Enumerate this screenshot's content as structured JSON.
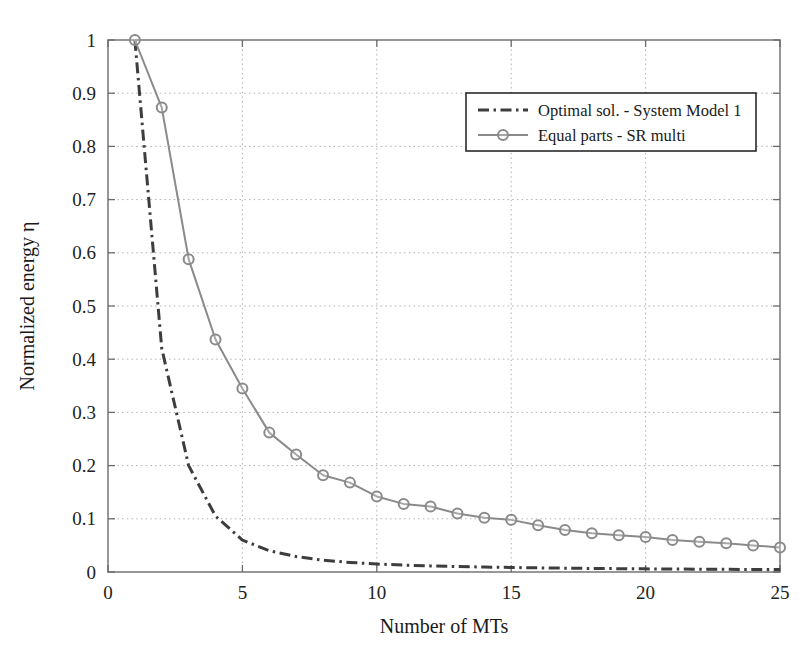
{
  "chart_data": {
    "type": "line",
    "title": "",
    "xlabel": "Number of MTs",
    "ylabel": "Normalized energy η",
    "xlim": [
      0,
      25
    ],
    "ylim": [
      0,
      1
    ],
    "xticks": [
      0,
      5,
      10,
      15,
      20,
      25
    ],
    "xtick_labels": [
      "0",
      "5",
      "10",
      "15",
      "20",
      "25"
    ],
    "yticks": [
      0,
      0.1,
      0.2,
      0.3,
      0.4,
      0.5,
      0.6,
      0.7,
      0.8,
      0.9,
      1
    ],
    "ytick_labels": [
      "0",
      "0.1",
      "0.2",
      "0.3",
      "0.4",
      "0.5",
      "0.6",
      "0.7",
      "0.8",
      "0.9",
      "1"
    ],
    "grid": true,
    "grid_style": "dotted",
    "legend_position": "upper-center-right",
    "x": [
      1,
      2,
      3,
      4,
      5,
      6,
      7,
      8,
      9,
      10,
      11,
      12,
      13,
      14,
      15,
      16,
      17,
      18,
      19,
      20,
      21,
      22,
      23,
      24,
      25
    ],
    "series": [
      {
        "name": "Optimal sol. - System Model 1",
        "style": "dash-dot",
        "marker": "none",
        "color": "#3d3d3d",
        "values": [
          1.0,
          0.42,
          0.2,
          0.105,
          0.06,
          0.04,
          0.029,
          0.022,
          0.018,
          0.015,
          0.013,
          0.0115,
          0.0103,
          0.0093,
          0.0085,
          0.0078,
          0.0072,
          0.0067,
          0.0063,
          0.0059,
          0.0056,
          0.0053,
          0.005,
          0.0048,
          0.0046
        ]
      },
      {
        "name": "Equal parts - SR multi",
        "style": "solid",
        "marker": "circle",
        "color": "#8a8a8a",
        "values": [
          1.0,
          0.873,
          0.588,
          0.437,
          0.345,
          0.262,
          0.221,
          0.182,
          0.168,
          0.142,
          0.128,
          0.123,
          0.11,
          0.102,
          0.098,
          0.088,
          0.079,
          0.073,
          0.069,
          0.066,
          0.06,
          0.057,
          0.054,
          0.05,
          0.046
        ]
      }
    ]
  },
  "legend": {
    "entries": [
      {
        "label": "Optimal sol. - System Model 1"
      },
      {
        "label": "Equal parts - SR multi"
      }
    ]
  },
  "colors": {
    "axis": "#6b6b6b",
    "grid": "#b0b0b0",
    "series_optimal": "#3d3d3d",
    "series_equal": "#8a8a8a",
    "text": "#1a1a1a",
    "legend_border": "#2a2a2a",
    "background": "#ffffff"
  }
}
